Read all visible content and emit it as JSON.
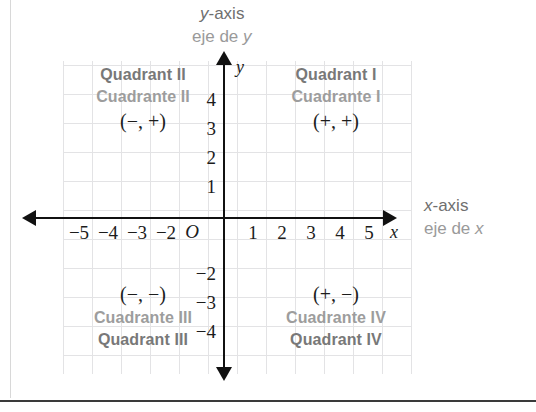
{
  "diagram": {
    "name": "cartesian-coordinate-plane-quadrants",
    "axis_titles": {
      "y_en_var": "y",
      "y_en_rest": "-axis",
      "y_es_rest": "eje de ",
      "y_es_var": "y",
      "x_en_var": "x",
      "x_en_rest": "-axis",
      "x_es_rest": "eje de ",
      "x_es_var": "x"
    },
    "axis_variables": {
      "x": "x",
      "y": "y"
    },
    "origin_label": "O",
    "x_ticks": [
      {
        "label": "−5",
        "value": -5
      },
      {
        "label": "−4",
        "value": -4
      },
      {
        "label": "−3",
        "value": -3
      },
      {
        "label": "−2",
        "value": -2
      },
      {
        "label": "1",
        "value": 1
      },
      {
        "label": "2",
        "value": 2
      },
      {
        "label": "3",
        "value": 3
      },
      {
        "label": "4",
        "value": 4
      },
      {
        "label": "5",
        "value": 5
      }
    ],
    "y_ticks": [
      {
        "label": "4",
        "value": 4
      },
      {
        "label": "3",
        "value": 3
      },
      {
        "label": "2",
        "value": 2
      },
      {
        "label": "1",
        "value": 1
      },
      {
        "label": "−2",
        "value": -2
      },
      {
        "label": "−3",
        "value": -3
      },
      {
        "label": "−4",
        "value": -4
      }
    ],
    "quadrants": [
      {
        "id": "quadrant-1",
        "english": "Quadrant I",
        "spanish": "Cuadrante I",
        "signs": "(+, +)"
      },
      {
        "id": "quadrant-2",
        "english": "Quadrant II",
        "spanish": "Cuadrante II",
        "signs": "(−, +)"
      },
      {
        "id": "quadrant-3",
        "english": "Quadrant III",
        "spanish": "Cuadrante III",
        "signs": "(−, −)"
      },
      {
        "id": "quadrant-4",
        "english": "Quadrant IV",
        "spanish": "Cuadrante IV",
        "signs": "(+, −)"
      }
    ],
    "colors": {
      "axis": "#111111",
      "grid": "#e3e3e5",
      "label_en": "#787878",
      "label_es": "#9d9d9d",
      "tick_text": "#1c1c1c",
      "axis_title": "#9a9a9a"
    }
  }
}
